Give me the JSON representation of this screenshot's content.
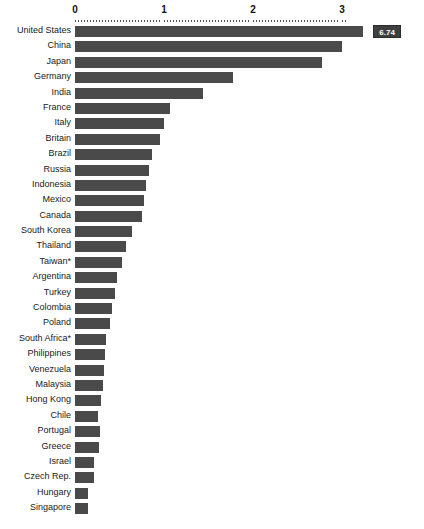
{
  "chart_data": {
    "type": "bar",
    "orientation": "horizontal",
    "title": "",
    "subtitle": "",
    "xlabel": "",
    "ylabel": "",
    "xlim": [
      0,
      3.4
    ],
    "xticks": [
      "0",
      "1",
      "2",
      "3"
    ],
    "xtick_values": [
      0,
      1,
      2,
      3
    ],
    "grid": false,
    "legend": null,
    "bar_color": "#4a4a4a",
    "axis_color": "#555555",
    "truncated_note": "United States bar is clipped at the axis maximum; its true value is shown in the callout label.",
    "categories": [
      "United  States",
      "China",
      "Japan",
      "Germany",
      "India",
      "France",
      "Italy",
      "Britain",
      "Brazil",
      "Russia",
      "Indonesia",
      "Mexico",
      "Canada",
      "South Korea",
      "Thailand",
      "Taiwan*",
      "Argentina",
      "Turkey",
      "Colombia",
      "Poland",
      "South Africa*",
      "Philippines",
      "Venezuela",
      "Malaysia",
      "Hong Kong",
      "Chile",
      "Portugal",
      "Greece",
      "Israel",
      "Czech Rep.",
      "Hungary",
      "Singapore"
    ],
    "values": [
      3.24,
      3.0,
      2.78,
      1.77,
      1.44,
      1.07,
      1.0,
      0.96,
      0.86,
      0.83,
      0.8,
      0.78,
      0.75,
      0.64,
      0.57,
      0.53,
      0.47,
      0.45,
      0.42,
      0.39,
      0.35,
      0.34,
      0.33,
      0.31,
      0.29,
      0.26,
      0.28,
      0.27,
      0.21,
      0.21,
      0.15,
      0.15
    ],
    "value_labels": [
      "6.74",
      "",
      "",
      "",
      "",
      "",
      "",
      "",
      "",
      "",
      "",
      "",
      "",
      "",
      "",
      "",
      "",
      "",
      "",
      "",
      "",
      "",
      "",
      "",
      "",
      "",
      "",
      "",
      "",
      "",
      "",
      ""
    ]
  }
}
